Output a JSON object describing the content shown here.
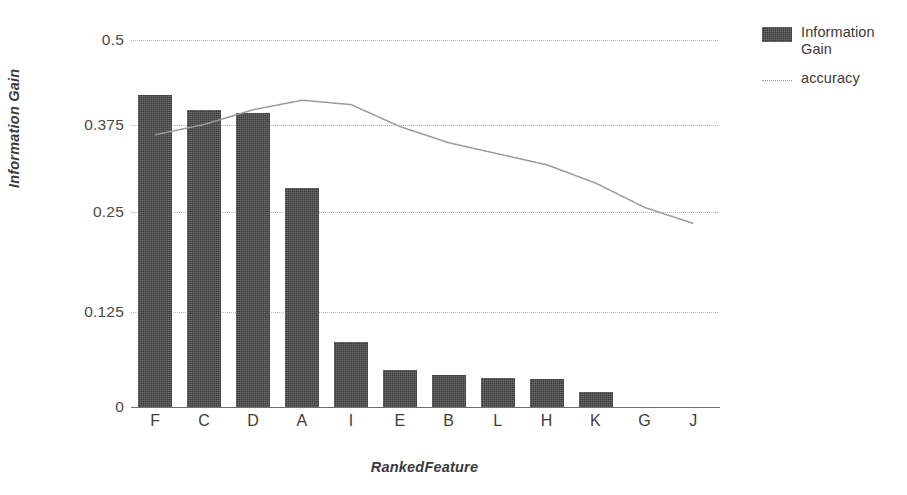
{
  "chart_data": {
    "type": "bar",
    "title": "",
    "subtitle": "",
    "xlabel": "RankedFeature",
    "ylabel": "Information Gain",
    "categories": [
      "F",
      "C",
      "D",
      "A",
      "I",
      "E",
      "B",
      "L",
      "H",
      "K",
      "G",
      "J"
    ],
    "ylim": [
      0,
      0.5
    ],
    "yticks": [
      "0",
      "0.125",
      "0.25",
      "0.375",
      "0.5"
    ],
    "ytick_values": [
      0,
      0.125,
      0.25,
      0.375,
      0.5
    ],
    "grid": true,
    "legend_position": "right",
    "series": [
      {
        "name": "Information Gain",
        "type": "bar",
        "color": "#3b3b3b",
        "values": [
          0.425,
          0.405,
          0.4,
          0.298,
          0.088,
          0.05,
          0.044,
          0.04,
          0.038,
          0.02,
          0.0,
          0.0
        ]
      },
      {
        "name": "accuracy",
        "type": "line",
        "color": "#9a9a9a",
        "values": [
          0.371,
          0.385,
          0.405,
          0.418,
          0.412,
          0.382,
          0.36,
          0.345,
          0.33,
          0.305,
          0.272,
          0.25
        ]
      }
    ]
  },
  "axes": {
    "y_title": "Information Gain",
    "x_title": "RankedFeature",
    "y_ticks": [
      "0.5",
      "0.375",
      "0.25",
      "0.125",
      "0"
    ],
    "x_ticks": [
      "F",
      "C",
      "D",
      "A",
      "I",
      "E",
      "B",
      "L",
      "H",
      "K",
      "G",
      "J"
    ]
  },
  "legend": {
    "items": [
      {
        "label": "Information Gain",
        "key": "swatch",
        "color": "#3b3b3b"
      },
      {
        "label": "accuracy",
        "key": "line",
        "color": "#9a9a9a"
      }
    ]
  }
}
